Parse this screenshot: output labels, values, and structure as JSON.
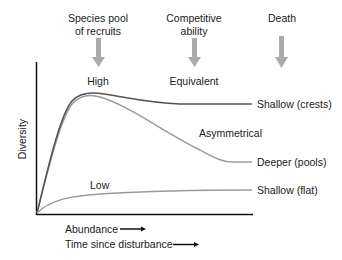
{
  "diagram": {
    "factors": [
      {
        "label_line1": "Species pool",
        "label_line2": "of recruits",
        "level": "High"
      },
      {
        "label_line1": "Competitive",
        "label_line2": "ability",
        "level": "Equivalent"
      },
      {
        "label_line1": "Death",
        "label_line2": "",
        "level": ""
      }
    ],
    "y_axis_label": "Diversity",
    "x_axis_labels": [
      "Abundance",
      "Time since disturbance"
    ],
    "curve_labels": {
      "asymmetrical": "Asymmetrical",
      "low": "Low",
      "shallow_crests": "Shallow (crests)",
      "deeper_pools": "Deeper (pools)",
      "shallow_flat": "Shallow (flat)"
    },
    "colors": {
      "axis": "#111111",
      "curve_top": "#555555",
      "curve_mid": "#999999",
      "curve_low": "#999999",
      "arrow": "#aaaaaa"
    }
  }
}
